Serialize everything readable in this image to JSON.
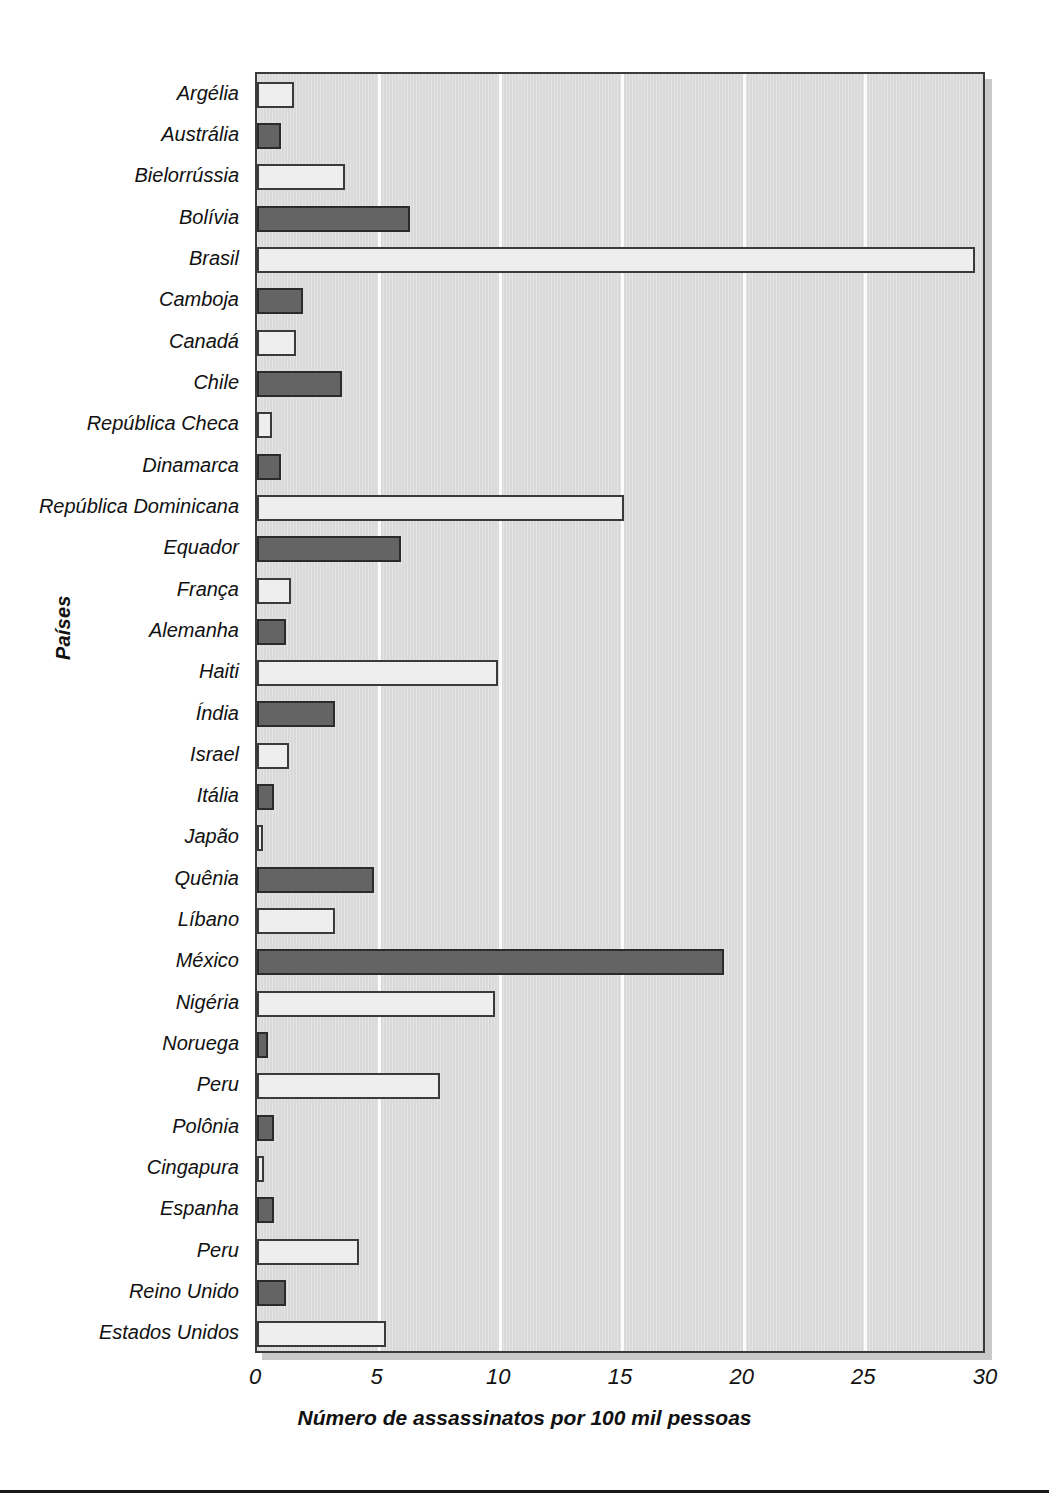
{
  "chart_data": {
    "type": "bar",
    "orientation": "horizontal",
    "title": "",
    "xlabel": "Número de assassinatos por 100 mil pessoas",
    "ylabel": "Países",
    "xlim": [
      0,
      30
    ],
    "xticks": [
      0,
      5,
      10,
      15,
      20,
      25,
      30
    ],
    "grid": true,
    "legend": null,
    "colors": {
      "light_bar": "#eeeeee",
      "dark_bar": "#646464",
      "panel": "#d9d9d9",
      "outline": "#3a3a3a",
      "gridline": "#fbfbfb",
      "text": "#111111"
    },
    "categories": [
      "Argélia",
      "Austrália",
      "Bielorrússia",
      "Bolívia",
      "Brasil",
      "Camboja",
      "Canadá",
      "Chile",
      "República Checa",
      "Dinamarca",
      "República Dominicana",
      "Equador",
      "França",
      "Alemanha",
      "Haiti",
      "Índia",
      "Israel",
      "Itália",
      "Japão",
      "Quênia",
      "Líbano",
      "México",
      "Nigéria",
      "Noruega",
      "Peru",
      "Polônia",
      "Cingapura",
      "Espanha",
      "Peru",
      "Reino Unido",
      "Estados Unidos"
    ],
    "values": [
      1.5,
      1.0,
      3.6,
      6.3,
      29.5,
      1.9,
      1.6,
      3.5,
      0.6,
      1.0,
      15.1,
      5.9,
      1.4,
      1.2,
      9.9,
      3.2,
      1.3,
      0.7,
      0.25,
      4.8,
      3.2,
      19.2,
      9.8,
      0.45,
      7.5,
      0.7,
      0.3,
      0.7,
      4.2,
      1.2,
      5.3
    ],
    "shades": [
      "light",
      "dark",
      "light",
      "dark",
      "light",
      "dark",
      "light",
      "dark",
      "light",
      "dark",
      "light",
      "dark",
      "light",
      "dark",
      "light",
      "dark",
      "light",
      "dark",
      "light",
      "dark",
      "light",
      "dark",
      "light",
      "dark",
      "light",
      "dark",
      "light",
      "dark",
      "light",
      "dark",
      "light"
    ]
  }
}
